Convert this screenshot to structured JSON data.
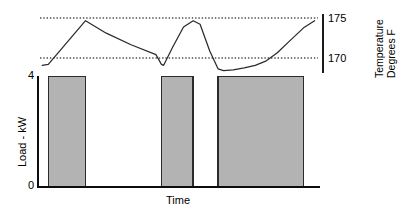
{
  "chart_data": {
    "type": "bar",
    "title": "",
    "subtitle": "",
    "xlabel": "Time",
    "ylabel": "Load - kW",
    "y2label": "Temperature Degrees F",
    "ylabel_line1": "Load - kW",
    "y2label_line1": "Temperature",
    "y2label_line2": "Degrees  F",
    "grid": false,
    "legend": "none",
    "ylim": [
      0,
      4
    ],
    "y_ticks": [
      "4",
      "0"
    ],
    "y_tick_values": [
      4,
      0
    ],
    "y2lim": [
      168.8,
      176.2
    ],
    "y2_ticks": [
      "175",
      "170"
    ],
    "y2_tick_values": [
      175,
      170
    ],
    "xlim": [
      0,
      100
    ],
    "x_ticks": [],
    "setpoint_lines": [
      {
        "label": "upper setpoint",
        "value": 175,
        "style": "dotted"
      },
      {
        "label": "lower setpoint",
        "value": 170,
        "style": "dotted"
      }
    ],
    "series": [
      {
        "name": "Load - kW",
        "type": "bar",
        "axis": "left",
        "color": "#b3b3b3",
        "edge_color": "#2b2b2b",
        "bars": [
          {
            "x_start": 3.0,
            "x_end": 16.5,
            "value": 4
          },
          {
            "x_start": 44.0,
            "x_end": 55.5,
            "value": 4
          },
          {
            "x_start": 64.5,
            "x_end": 95.5,
            "value": 4
          }
        ]
      },
      {
        "name": "Temperature Degrees F",
        "type": "line",
        "axis": "right",
        "color": "#2b2b2b",
        "x": [
          0.8,
          3.0,
          16.5,
          24.0,
          33.0,
          42.0,
          44.0,
          44.8,
          48.0,
          52.0,
          55.5,
          58.0,
          61.5,
          64.5,
          66.5,
          70.0,
          74.0,
          78.0,
          82.0,
          86.0,
          90.0,
          95.5,
          99.5
        ],
        "y": [
          170.0,
          170.1,
          175.0,
          173.6,
          172.3,
          171.2,
          170.1,
          170.0,
          172.0,
          174.3,
          175.0,
          174.6,
          171.6,
          169.6,
          169.4,
          169.5,
          169.7,
          170.0,
          170.5,
          171.4,
          172.6,
          174.2,
          175.0
        ]
      }
    ]
  },
  "axes": {
    "left_title": "Load - kW",
    "left_ticks": [
      "4",
      "0"
    ],
    "right_ticks": [
      "175",
      "170"
    ],
    "right_title_line1": "Temperature",
    "right_title_line2": "Degrees  F",
    "bottom_title": "Time"
  },
  "colors": {
    "bar_fill": "#b3b3b3",
    "bar_edge": "#2b2b2b",
    "line": "#2b2b2b",
    "axis": "#0d0d0d",
    "setpoint": "#4d4d4d",
    "background": "#ffffff"
  }
}
